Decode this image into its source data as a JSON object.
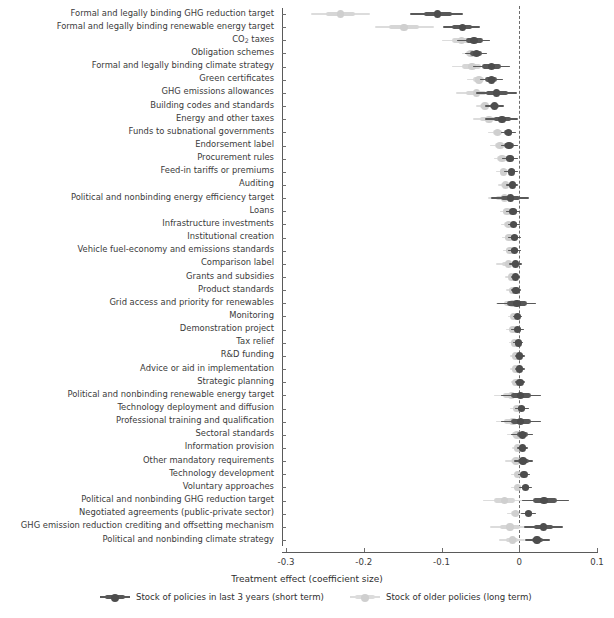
{
  "chart_data": {
    "type": "scatter",
    "plot_style": "forest-plot",
    "title": "",
    "xlabel": "Treatment effect (coefficient size)",
    "ylabel": "",
    "xlim": [
      -0.3,
      0.1
    ],
    "xticks": [
      -0.3,
      -0.2,
      -0.1,
      0,
      0.1
    ],
    "xticklabels": [
      "-0.3",
      "-0.2",
      "-0.1",
      "0",
      "0.1"
    ],
    "grid": false,
    "reference_line": 0,
    "legend_position": "bottom",
    "colors": {
      "short_term": "#4d4d4d",
      "long_term": "#cfcfcf",
      "reference_line": "#6b6b6b"
    },
    "series": [
      {
        "name": "Stock of policies in last 3 years (short term)",
        "key": "short",
        "color": "#4d4d4d"
      },
      {
        "name": "Stock of older policies (long term)",
        "key": "long",
        "color": "#cfcfcf"
      }
    ],
    "categories": [
      "Formal and legally binding GHG reduction target",
      "Formal and legally binding renewable energy target",
      "CO2 taxes",
      "Obligation schemes",
      "Formal and legally binding climate strategy",
      "Green certificates",
      "GHG emissions allowances",
      "Building codes and standards",
      "Energy and other taxes",
      "Funds to subnational governments",
      "Endorsement label",
      "Procurement rules",
      "Feed-in tariffs or premiums",
      "Auditing",
      "Political and nonbinding energy efficiency target",
      "Loans",
      "Infrastructure investments",
      "Institutional creation",
      "Vehicle fuel-economy and emissions standards",
      "Comparison label",
      "Grants and subsidies",
      "Product standards",
      "Grid access and priority for renewables",
      "Monitoring",
      "Demonstration project",
      "Tax relief",
      "R&D funding",
      "Advice or aid in implementation",
      "Strategic planning",
      "Political and nonbinding renewable energy target",
      "Technology deployment and diffusion",
      "Professional training and qualification",
      "Sectoral standards",
      "Information provision",
      "Other mandatory requirements",
      "Technology development",
      "Voluntary approaches",
      "Political and nonbinding GHG reduction target",
      "Negotiated agreements (public-private sector)",
      "GHG emission reduction crediting and offsetting mechanism",
      "Political and nonbinding climate strategy"
    ],
    "points": {
      "short": [
        {
          "est": -0.105,
          "lo90": -0.14,
          "hi90": -0.072,
          "lo50": -0.123,
          "hi50": -0.087
        },
        {
          "est": -0.073,
          "lo90": -0.098,
          "hi90": -0.05,
          "lo50": -0.086,
          "hi50": -0.061
        },
        {
          "est": -0.058,
          "lo90": -0.08,
          "hi90": -0.037,
          "lo50": -0.069,
          "hi50": -0.047
        },
        {
          "est": -0.055,
          "lo90": -0.07,
          "hi90": -0.041,
          "lo50": -0.063,
          "hi50": -0.048
        },
        {
          "est": -0.036,
          "lo90": -0.06,
          "hi90": -0.012,
          "lo50": -0.048,
          "hi50": -0.024
        },
        {
          "est": -0.036,
          "lo90": -0.051,
          "hi90": -0.021,
          "lo50": -0.044,
          "hi50": -0.028
        },
        {
          "est": -0.029,
          "lo90": -0.056,
          "hi90": -0.003,
          "lo50": -0.043,
          "hi50": -0.015
        },
        {
          "est": -0.032,
          "lo90": -0.044,
          "hi90": -0.02,
          "lo50": -0.038,
          "hi50": -0.026
        },
        {
          "est": -0.022,
          "lo90": -0.044,
          "hi90": -0.001,
          "lo50": -0.033,
          "hi50": -0.011
        },
        {
          "est": -0.014,
          "lo90": -0.024,
          "hi90": -0.004,
          "lo50": -0.019,
          "hi50": -0.009
        },
        {
          "est": -0.013,
          "lo90": -0.024,
          "hi90": -0.002,
          "lo50": -0.019,
          "hi50": -0.007
        },
        {
          "est": -0.012,
          "lo90": -0.022,
          "hi90": -0.002,
          "lo50": -0.017,
          "hi50": -0.007
        },
        {
          "est": -0.01,
          "lo90": -0.019,
          "hi90": -0.001,
          "lo50": -0.015,
          "hi50": -0.005
        },
        {
          "est": -0.009,
          "lo90": -0.017,
          "hi90": -0.001,
          "lo50": -0.013,
          "hi50": -0.005
        },
        {
          "est": -0.011,
          "lo90": -0.036,
          "hi90": 0.013,
          "lo50": -0.023,
          "hi50": 0.001
        },
        {
          "est": -0.008,
          "lo90": -0.017,
          "hi90": 0.001,
          "lo50": -0.012,
          "hi50": -0.003
        },
        {
          "est": -0.007,
          "lo90": -0.015,
          "hi90": 0.001,
          "lo50": -0.011,
          "hi50": -0.003
        },
        {
          "est": -0.006,
          "lo90": -0.014,
          "hi90": 0.002,
          "lo50": -0.01,
          "hi50": -0.002
        },
        {
          "est": -0.006,
          "lo90": -0.014,
          "hi90": 0.002,
          "lo50": -0.01,
          "hi50": -0.002
        },
        {
          "est": -0.005,
          "lo90": -0.013,
          "hi90": 0.003,
          "lo50": -0.009,
          "hi50": -0.001
        },
        {
          "est": -0.005,
          "lo90": -0.011,
          "hi90": 0.001,
          "lo50": -0.008,
          "hi50": -0.002
        },
        {
          "est": -0.004,
          "lo90": -0.01,
          "hi90": 0.002,
          "lo50": -0.007,
          "hi50": -0.001
        },
        {
          "est": -0.003,
          "lo90": -0.029,
          "hi90": 0.022,
          "lo50": -0.016,
          "hi50": 0.01
        },
        {
          "est": -0.002,
          "lo90": -0.008,
          "hi90": 0.004,
          "lo50": -0.005,
          "hi50": 0.001
        },
        {
          "est": -0.002,
          "lo90": -0.01,
          "hi90": 0.006,
          "lo50": -0.006,
          "hi50": 0.002
        },
        {
          "est": -0.001,
          "lo90": -0.008,
          "hi90": 0.005,
          "lo50": -0.005,
          "hi50": 0.002
        },
        {
          "est": 0.0,
          "lo90": -0.006,
          "hi90": 0.007,
          "lo50": -0.003,
          "hi50": 0.004
        },
        {
          "est": 0.0,
          "lo90": -0.006,
          "hi90": 0.007,
          "lo50": -0.003,
          "hi50": 0.004
        },
        {
          "est": 0.001,
          "lo90": -0.005,
          "hi90": 0.007,
          "lo50": -0.002,
          "hi50": 0.004
        },
        {
          "est": 0.002,
          "lo90": -0.024,
          "hi90": 0.028,
          "lo50": -0.011,
          "hi50": 0.015
        },
        {
          "est": 0.003,
          "lo90": -0.006,
          "hi90": 0.012,
          "lo50": -0.001,
          "hi50": 0.008
        },
        {
          "est": 0.002,
          "lo90": -0.024,
          "hi90": 0.028,
          "lo50": -0.011,
          "hi50": 0.015
        },
        {
          "est": 0.004,
          "lo90": -0.01,
          "hi90": 0.018,
          "lo50": -0.003,
          "hi50": 0.011
        },
        {
          "est": 0.004,
          "lo90": -0.003,
          "hi90": 0.011,
          "lo50": 0.0,
          "hi50": 0.008
        },
        {
          "est": 0.005,
          "lo90": -0.007,
          "hi90": 0.018,
          "lo50": -0.001,
          "hi50": 0.012
        },
        {
          "est": 0.006,
          "lo90": -0.002,
          "hi90": 0.014,
          "lo50": 0.002,
          "hi50": 0.01
        },
        {
          "est": 0.008,
          "lo90": 0.0,
          "hi90": 0.016,
          "lo50": 0.004,
          "hi50": 0.012
        },
        {
          "est": 0.032,
          "lo90": 0.004,
          "hi90": 0.064,
          "lo50": 0.018,
          "hi50": 0.048
        },
        {
          "est": 0.012,
          "lo90": 0.002,
          "hi90": 0.022,
          "lo50": 0.007,
          "hi50": 0.017
        },
        {
          "est": 0.031,
          "lo90": 0.006,
          "hi90": 0.056,
          "lo50": 0.019,
          "hi50": 0.044
        },
        {
          "est": 0.023,
          "lo90": 0.008,
          "hi90": 0.04,
          "lo50": 0.016,
          "hi50": 0.031
        }
      ],
      "long": [
        {
          "est": -0.23,
          "lo90": -0.268,
          "hi90": -0.192,
          "lo50": -0.249,
          "hi50": -0.211
        },
        {
          "est": -0.148,
          "lo90": -0.186,
          "hi90": -0.11,
          "lo50": -0.167,
          "hi50": -0.129
        },
        {
          "est": -0.074,
          "lo90": -0.1,
          "hi90": -0.048,
          "lo50": -0.087,
          "hi50": -0.061
        },
        {
          "est": -0.062,
          "lo90": -0.074,
          "hi90": -0.05,
          "lo50": -0.068,
          "hi50": -0.056
        },
        {
          "est": -0.061,
          "lo90": -0.087,
          "hi90": -0.036,
          "lo50": -0.074,
          "hi50": -0.049
        },
        {
          "est": -0.052,
          "lo90": -0.067,
          "hi90": -0.038,
          "lo50": -0.06,
          "hi50": -0.045
        },
        {
          "est": -0.055,
          "lo90": -0.081,
          "hi90": -0.03,
          "lo50": -0.068,
          "hi50": -0.043
        },
        {
          "est": -0.044,
          "lo90": -0.055,
          "hi90": -0.033,
          "lo50": -0.05,
          "hi50": -0.039
        },
        {
          "est": -0.039,
          "lo90": -0.06,
          "hi90": -0.018,
          "lo50": -0.05,
          "hi50": -0.029
        },
        {
          "est": -0.028,
          "lo90": -0.04,
          "hi90": -0.016,
          "lo50": -0.034,
          "hi50": -0.022
        },
        {
          "est": -0.025,
          "lo90": -0.037,
          "hi90": -0.013,
          "lo50": -0.031,
          "hi50": -0.019
        },
        {
          "est": -0.022,
          "lo90": -0.033,
          "hi90": -0.011,
          "lo50": -0.028,
          "hi50": -0.016
        },
        {
          "est": -0.02,
          "lo90": -0.03,
          "hi90": -0.01,
          "lo50": -0.025,
          "hi50": -0.015
        },
        {
          "est": -0.018,
          "lo90": -0.027,
          "hi90": -0.009,
          "lo50": -0.023,
          "hi50": -0.013
        },
        {
          "est": -0.019,
          "lo90": -0.04,
          "hi90": 0.002,
          "lo50": -0.03,
          "hi50": -0.008
        },
        {
          "est": -0.016,
          "lo90": -0.025,
          "hi90": -0.007,
          "lo50": -0.021,
          "hi50": -0.011
        },
        {
          "est": -0.014,
          "lo90": -0.023,
          "hi90": -0.005,
          "lo50": -0.019,
          "hi50": -0.009
        },
        {
          "est": -0.013,
          "lo90": -0.022,
          "hi90": -0.004,
          "lo50": -0.018,
          "hi50": -0.008
        },
        {
          "est": -0.012,
          "lo90": -0.021,
          "hi90": -0.003,
          "lo50": -0.017,
          "hi50": -0.007
        },
        {
          "est": -0.014,
          "lo90": -0.03,
          "hi90": 0.002,
          "lo50": -0.022,
          "hi50": -0.006
        },
        {
          "est": -0.01,
          "lo90": -0.018,
          "hi90": -0.002,
          "lo50": -0.014,
          "hi50": -0.006
        },
        {
          "est": -0.009,
          "lo90": -0.017,
          "hi90": -0.001,
          "lo50": -0.013,
          "hi50": -0.005
        },
        {
          "est": -0.008,
          "lo90": -0.03,
          "hi90": 0.014,
          "lo50": -0.019,
          "hi50": 0.003
        },
        {
          "est": -0.007,
          "lo90": -0.014,
          "hi90": 0.0,
          "lo50": -0.01,
          "hi50": -0.004
        },
        {
          "est": -0.008,
          "lo90": -0.017,
          "hi90": 0.001,
          "lo50": -0.012,
          "hi50": -0.004
        },
        {
          "est": -0.006,
          "lo90": -0.013,
          "hi90": 0.001,
          "lo50": -0.009,
          "hi50": -0.003
        },
        {
          "est": -0.005,
          "lo90": -0.012,
          "hi90": 0.002,
          "lo50": -0.008,
          "hi50": -0.002
        },
        {
          "est": -0.005,
          "lo90": -0.012,
          "hi90": 0.002,
          "lo50": -0.008,
          "hi50": -0.002
        },
        {
          "est": -0.004,
          "lo90": -0.011,
          "hi90": 0.003,
          "lo50": -0.007,
          "hi50": -0.001
        },
        {
          "est": -0.01,
          "lo90": -0.032,
          "hi90": 0.012,
          "lo50": -0.021,
          "hi50": 0.001
        },
        {
          "est": -0.003,
          "lo90": -0.012,
          "hi90": 0.006,
          "lo50": -0.007,
          "hi50": 0.001
        },
        {
          "est": -0.008,
          "lo90": -0.03,
          "hi90": 0.014,
          "lo50": -0.019,
          "hi50": 0.003
        },
        {
          "est": -0.003,
          "lo90": -0.016,
          "hi90": 0.01,
          "lo50": -0.009,
          "hi50": 0.003
        },
        {
          "est": -0.002,
          "lo90": -0.009,
          "hi90": 0.005,
          "lo50": -0.005,
          "hi50": 0.001
        },
        {
          "est": -0.004,
          "lo90": -0.018,
          "hi90": 0.01,
          "lo50": -0.011,
          "hi50": 0.003
        },
        {
          "est": -0.002,
          "lo90": -0.01,
          "hi90": 0.006,
          "lo50": -0.006,
          "hi50": 0.002
        },
        {
          "est": -0.002,
          "lo90": -0.01,
          "hi90": 0.006,
          "lo50": -0.006,
          "hi50": 0.002
        },
        {
          "est": -0.019,
          "lo90": -0.046,
          "hi90": 0.008,
          "lo50": -0.033,
          "hi50": -0.006
        },
        {
          "est": -0.005,
          "lo90": -0.016,
          "hi90": 0.006,
          "lo50": -0.01,
          "hi50": 0.0
        },
        {
          "est": -0.012,
          "lo90": -0.038,
          "hi90": 0.014,
          "lo50": -0.025,
          "hi50": 0.001
        },
        {
          "est": -0.009,
          "lo90": -0.026,
          "hi90": 0.008,
          "lo50": -0.017,
          "hi50": -0.001
        }
      ]
    }
  },
  "legend": {
    "items": [
      {
        "label": "Stock of policies in last 3 years (short term)"
      },
      {
        "label": "Stock of older policies (long term)"
      }
    ]
  }
}
